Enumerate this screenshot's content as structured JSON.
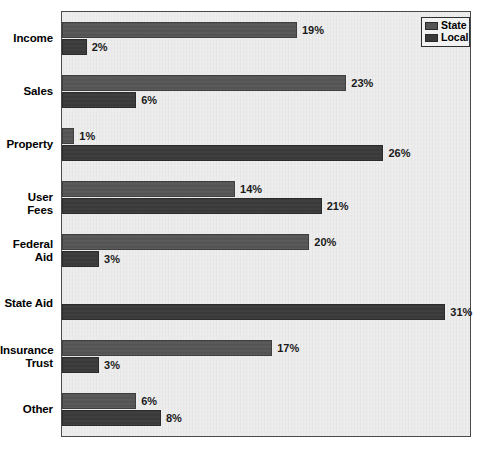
{
  "chart_data": {
    "type": "bar",
    "orientation": "horizontal",
    "title": "",
    "xlabel": "",
    "ylabel": "",
    "grid": false,
    "legend_position": "top-right",
    "value_suffix": "%",
    "xlim": [
      0,
      33
    ],
    "categories": [
      "Income",
      "Sales",
      "Property",
      "User Fees",
      "Federal Aid",
      "State Aid",
      "Insurance Trust",
      "Other"
    ],
    "series": [
      {
        "name": "State",
        "color": "#555555",
        "values": [
          19,
          23,
          1,
          14,
          20,
          0,
          17,
          6
        ],
        "labels": [
          "19%",
          "23%",
          "1%",
          "14%",
          "20%",
          "",
          "17%",
          "6%"
        ]
      },
      {
        "name": "Local",
        "color": "#3a3a3a",
        "values": [
          2,
          6,
          26,
          21,
          3,
          31,
          3,
          8
        ],
        "labels": [
          "2%",
          "6%",
          "26%",
          "21%",
          "3%",
          "31%",
          "3%",
          "8%"
        ]
      }
    ]
  },
  "legend": {
    "items": [
      {
        "label": "State",
        "swatch": "state"
      },
      {
        "label": "Local",
        "swatch": "local"
      }
    ]
  },
  "axis": {
    "category_labels": [
      {
        "lines": [
          "Income"
        ]
      },
      {
        "lines": [
          "Sales"
        ]
      },
      {
        "lines": [
          "Property"
        ]
      },
      {
        "lines": [
          "User Fees"
        ]
      },
      {
        "lines": [
          "Federal",
          "Aid"
        ]
      },
      {
        "lines": [
          "State Aid"
        ]
      },
      {
        "lines": [
          "Insurance",
          "Trust"
        ]
      },
      {
        "lines": [
          "Other"
        ]
      }
    ]
  },
  "colors": {
    "state_bar": "#555555",
    "local_bar": "#3a3a3a",
    "plot_background": "#e8e8e8",
    "page_background": "#ffffff",
    "frame_border": "#4a4a4a",
    "value_text": "#1a1a1a"
  },
  "title_remnant": ""
}
